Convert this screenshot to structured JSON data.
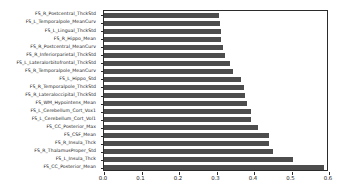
{
  "chart_data": {
    "type": "bar",
    "orientation": "horizontal",
    "title": "",
    "xlabel": "",
    "ylabel": "",
    "xlim": [
      0.0,
      0.6
    ],
    "ylim": [
      0,
      19
    ],
    "grid": false,
    "legend": null,
    "bar_color": "#4d4d4d",
    "xticks": [
      "0.0",
      "0.1",
      "0.2",
      "0.3",
      "0.4",
      "0.5",
      "0.6"
    ],
    "xtick_values": [
      0.0,
      0.1,
      0.2,
      0.3,
      0.4,
      0.5,
      0.6
    ],
    "categories": [
      "FS_R_Postcentral_ThckStd",
      "FS_L_Temporalpole_MeanCurv",
      "FS_L_Lingual_ThckStd",
      "FS_R_Hippo_Mean",
      "FS_R_Postcentral_MeanCurv",
      "FS_R_Inferiorparietal_ThckStd",
      "FS_L_Lateralorbitofrontal_ThckStd",
      "FS_R_Temporalpole_MeanCurv",
      "FS_L_Hippo_Std",
      "FS_R_Temporalpole_ThckStd",
      "FS_R_Lateraloccipital_ThckStd",
      "FS_WM_Hypointens_Mean",
      "FS_L_Cerebellum_Cort_Vox1",
      "FS_L_Cerebellum_Cort_Vol1",
      "FS_CC_Posterior_Max",
      "FS_CSF_Mean",
      "FS_R_Insula_Thck",
      "FS_R_ThalamusProper_Std",
      "FS_L_Insula_Thck",
      "FS_CC_Posterior_Mean"
    ],
    "values": [
      0.307,
      0.308,
      0.311,
      0.312,
      0.318,
      0.323,
      0.337,
      0.343,
      0.364,
      0.373,
      0.376,
      0.381,
      0.391,
      0.392,
      0.411,
      0.44,
      0.441,
      0.45,
      0.503,
      0.586
    ]
  }
}
